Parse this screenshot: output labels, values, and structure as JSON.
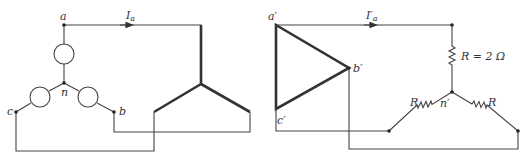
{
  "left_circuit": {
    "nodes": {
      "a": "a",
      "b": "b",
      "c": "c",
      "n": "n"
    },
    "current_label": "I",
    "current_sub": "a",
    "sources": [
      "source-a",
      "source-b",
      "source-c"
    ],
    "load": "delta-load"
  },
  "right_circuit": {
    "nodes": {
      "a": "a′",
      "b": "b′",
      "c": "c′",
      "n": "n′"
    },
    "current_label": "I′",
    "current_sub": "a",
    "resistor_top_label": "R = 2 Ω",
    "resistor_left_label": "R",
    "resistor_right_label": "R"
  },
  "colors": {
    "line": "#444444",
    "background": "#ffffff"
  }
}
